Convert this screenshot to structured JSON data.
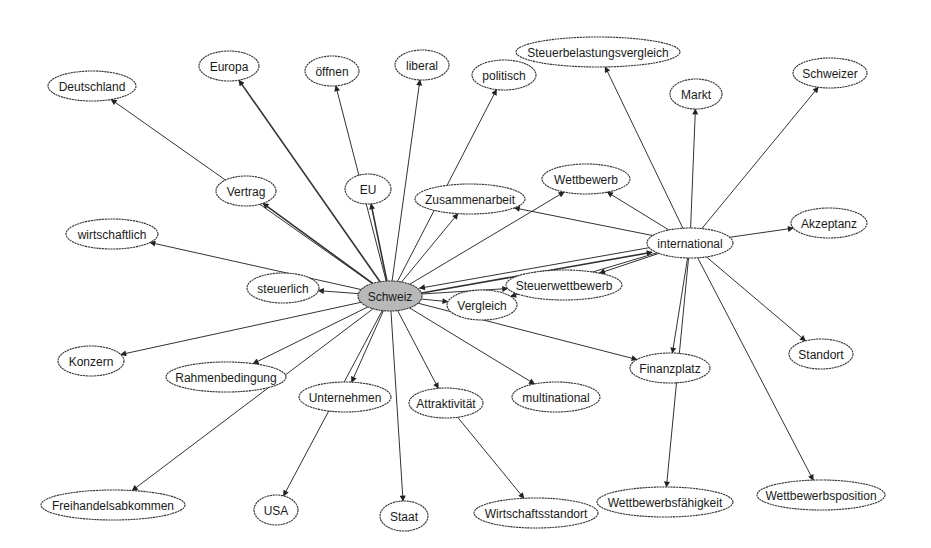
{
  "diagram": {
    "type": "directed-network",
    "colors": {
      "central_fill": "#b8b8b8",
      "node_fill": "#ffffff",
      "stroke": "#333333"
    },
    "nodes": [
      {
        "id": "schweiz",
        "label": "Schweiz",
        "x": 390,
        "y": 296,
        "rx": 32,
        "ry": 15,
        "central": true
      },
      {
        "id": "international",
        "label": "international",
        "x": 690,
        "y": 243,
        "rx": 43,
        "ry": 15
      },
      {
        "id": "deutschland",
        "label": "Deutschland",
        "x": 92,
        "y": 86,
        "rx": 44,
        "ry": 15
      },
      {
        "id": "europa",
        "label": "Europa",
        "x": 229,
        "y": 66,
        "rx": 30,
        "ry": 15
      },
      {
        "id": "oeffnen",
        "label": "öffnen",
        "x": 332,
        "y": 71,
        "rx": 27,
        "ry": 15
      },
      {
        "id": "liberal",
        "label": "liberal",
        "x": 422,
        "y": 65,
        "rx": 27,
        "ry": 15
      },
      {
        "id": "politisch",
        "label": "politisch",
        "x": 504,
        "y": 75,
        "rx": 32,
        "ry": 15
      },
      {
        "id": "steuerbelastungsvergleich",
        "label": "Steuerbelastungsvergleich",
        "x": 598,
        "y": 52,
        "rx": 82,
        "ry": 15
      },
      {
        "id": "markt",
        "label": "Markt",
        "x": 696,
        "y": 94,
        "rx": 26,
        "ry": 15
      },
      {
        "id": "schweizer",
        "label": "Schweizer",
        "x": 830,
        "y": 73,
        "rx": 37,
        "ry": 15
      },
      {
        "id": "vertrag",
        "label": "Vertrag",
        "x": 246,
        "y": 191,
        "rx": 30,
        "ry": 15
      },
      {
        "id": "eu",
        "label": "EU",
        "x": 368,
        "y": 189,
        "rx": 23,
        "ry": 15
      },
      {
        "id": "zusammenarbeit",
        "label": "Zusammenarbeit",
        "x": 470,
        "y": 199,
        "rx": 55,
        "ry": 15
      },
      {
        "id": "wettbewerb",
        "label": "Wettbewerb",
        "x": 586,
        "y": 179,
        "rx": 44,
        "ry": 15
      },
      {
        "id": "akzeptanz",
        "label": "Akzeptanz",
        "x": 829,
        "y": 223,
        "rx": 38,
        "ry": 15
      },
      {
        "id": "wirtschaftlich",
        "label": "wirtschaftlich",
        "x": 112,
        "y": 234,
        "rx": 46,
        "ry": 15
      },
      {
        "id": "steuerlich",
        "label": "steuerlich",
        "x": 283,
        "y": 288,
        "rx": 36,
        "ry": 15
      },
      {
        "id": "vergleich",
        "label": "Vergleich",
        "x": 482,
        "y": 305,
        "rx": 35,
        "ry": 15
      },
      {
        "id": "steuerwettbewerb",
        "label": "Steuerwettbewerb",
        "x": 564,
        "y": 285,
        "rx": 58,
        "ry": 15
      },
      {
        "id": "konzern",
        "label": "Konzern",
        "x": 91,
        "y": 361,
        "rx": 33,
        "ry": 15
      },
      {
        "id": "rahmenbedingung",
        "label": "Rahmenbedingung",
        "x": 226,
        "y": 377,
        "rx": 60,
        "ry": 15
      },
      {
        "id": "unternehmen",
        "label": "Unternehmen",
        "x": 345,
        "y": 397,
        "rx": 46,
        "ry": 15
      },
      {
        "id": "attraktivitaet",
        "label": "Attraktivität",
        "x": 446,
        "y": 403,
        "rx": 37,
        "ry": 15
      },
      {
        "id": "multinational",
        "label": "multinational",
        "x": 556,
        "y": 397,
        "rx": 44,
        "ry": 15
      },
      {
        "id": "finanzplatz",
        "label": "Finanzplatz",
        "x": 670,
        "y": 368,
        "rx": 40,
        "ry": 15
      },
      {
        "id": "standort",
        "label": "Standort",
        "x": 821,
        "y": 354,
        "rx": 32,
        "ry": 15
      },
      {
        "id": "freihandelsabkommen",
        "label": "Freihandelsabkommen",
        "x": 113,
        "y": 505,
        "rx": 72,
        "ry": 15
      },
      {
        "id": "usa",
        "label": "USA",
        "x": 276,
        "y": 510,
        "rx": 22,
        "ry": 15
      },
      {
        "id": "staat",
        "label": "Staat",
        "x": 404,
        "y": 516,
        "rx": 24,
        "ry": 15
      },
      {
        "id": "wirtschaftsstandort",
        "label": "Wirtschaftsstandort",
        "x": 536,
        "y": 513,
        "rx": 62,
        "ry": 15
      },
      {
        "id": "wettbewerbsfaehigkeit",
        "label": "Wettbewerbsfähigkeit",
        "x": 665,
        "y": 502,
        "rx": 68,
        "ry": 15
      },
      {
        "id": "wettbewerbsposition",
        "label": "Wettbewerbsposition",
        "x": 821,
        "y": 495,
        "rx": 64,
        "ry": 15
      }
    ],
    "edges": [
      {
        "from": "schweiz",
        "to": "deutschland"
      },
      {
        "from": "schweiz",
        "to": "europa",
        "thick": true
      },
      {
        "from": "schweiz",
        "to": "oeffnen"
      },
      {
        "from": "schweiz",
        "to": "liberal"
      },
      {
        "from": "schweiz",
        "to": "politisch"
      },
      {
        "from": "schweiz",
        "to": "vertrag",
        "thick": true
      },
      {
        "from": "schweiz",
        "to": "eu",
        "thick": true
      },
      {
        "from": "schweiz",
        "to": "zusammenarbeit"
      },
      {
        "from": "schweiz",
        "to": "wettbewerb"
      },
      {
        "from": "schweiz",
        "to": "wirtschaftlich"
      },
      {
        "from": "schweiz",
        "to": "steuerlich"
      },
      {
        "from": "schweiz",
        "to": "vergleich"
      },
      {
        "from": "schweiz",
        "to": "steuerwettbewerb"
      },
      {
        "from": "schweiz",
        "to": "international",
        "thick": true
      },
      {
        "from": "schweiz",
        "to": "konzern"
      },
      {
        "from": "schweiz",
        "to": "rahmenbedingung"
      },
      {
        "from": "schweiz",
        "to": "freihandelsabkommen"
      },
      {
        "from": "schweiz",
        "to": "unternehmen"
      },
      {
        "from": "schweiz",
        "to": "usa"
      },
      {
        "from": "schweiz",
        "to": "staat"
      },
      {
        "from": "schweiz",
        "to": "attraktivitaet"
      },
      {
        "from": "schweiz",
        "to": "multinational"
      },
      {
        "from": "schweiz",
        "to": "finanzplatz"
      },
      {
        "from": "attraktivitaet",
        "to": "wirtschaftsstandort"
      },
      {
        "from": "international",
        "to": "schweiz"
      },
      {
        "from": "international",
        "to": "steuerbelastungsvergleich"
      },
      {
        "from": "international",
        "to": "markt"
      },
      {
        "from": "international",
        "to": "schweizer"
      },
      {
        "from": "international",
        "to": "akzeptanz"
      },
      {
        "from": "international",
        "to": "wettbewerb"
      },
      {
        "from": "international",
        "to": "zusammenarbeit"
      },
      {
        "from": "international",
        "to": "steuerwettbewerb"
      },
      {
        "from": "international",
        "to": "vergleich"
      },
      {
        "from": "international",
        "to": "finanzplatz"
      },
      {
        "from": "international",
        "to": "wettbewerbsfaehigkeit"
      },
      {
        "from": "international",
        "to": "wettbewerbsposition"
      },
      {
        "from": "international",
        "to": "standort"
      }
    ]
  }
}
